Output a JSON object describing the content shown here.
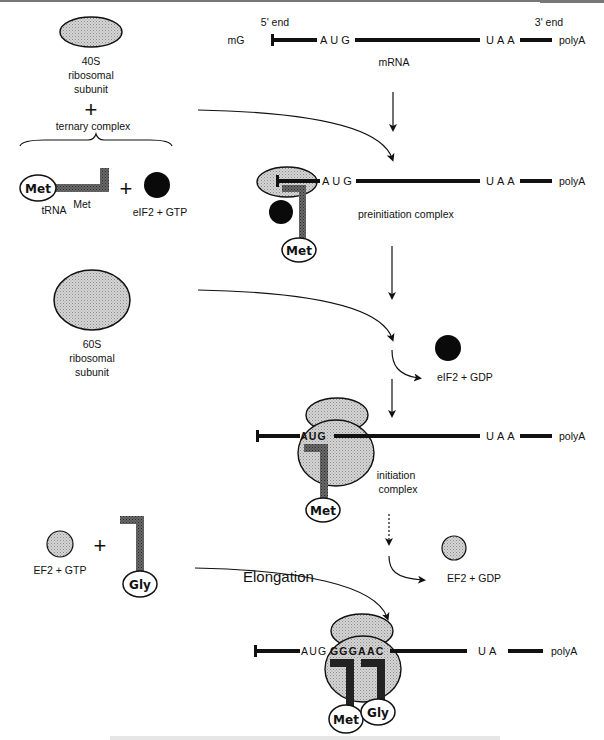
{
  "colors": {
    "ink": "#111111",
    "ribosome_fill": "#c8c8c8",
    "trna_fill": "#555555",
    "eif2_fill": "#0a0a0a",
    "ef2_fill": "#9a9a9a",
    "background": "#ffffff"
  },
  "inputs": {
    "subunit_40s": {
      "line1": "40S",
      "line2": "ribosomal",
      "line3": "subunit"
    },
    "plus": "+",
    "ternary_complex": "ternary complex",
    "met_trna": {
      "amino_acid": "Met",
      "label": "tRNA",
      "superscript": "Met"
    },
    "eif2_gtp": "eIF2 + GTP",
    "subunit_60s": {
      "line1": "60S",
      "line2": "ribosomal",
      "line3": "subunit"
    },
    "ef2_gtp": "EF2 + GTP",
    "gly_trna": {
      "amino_acid": "Gly"
    }
  },
  "mrna": {
    "five_prime": "5' end",
    "three_prime": "3' end",
    "cap": "mG",
    "start_codon": "AUG",
    "stop_codon": "UAA",
    "tail": "polyA",
    "label": "mRNA"
  },
  "stages": {
    "preinitiation": {
      "label": "preinitiation complex",
      "start_codon": "AUG",
      "stop_codon": "UAA",
      "tail": "polyA",
      "amino_acid": "Met"
    },
    "release_eif2": {
      "label": "eIF2 + GDP"
    },
    "initiation": {
      "label_line1": "initiation",
      "label_line2": "complex",
      "start_codon": "AUG",
      "stop_codon": "UAA",
      "tail": "polyA",
      "amino_acid": "Met"
    },
    "elongation": {
      "title": "Elongation",
      "release_ef2": "EF2 + GDP",
      "sequence_lead": "AUG",
      "sequence_codons": "GGGAAC",
      "stop_codon": "UA",
      "tail": "polyA",
      "amino_acids": [
        "Met",
        "Gly"
      ]
    }
  }
}
